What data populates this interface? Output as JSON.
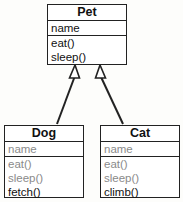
{
  "diagram": {
    "type": "uml-class-inheritance",
    "classes": {
      "pet": {
        "name": "Pet",
        "attributes": [
          "name"
        ],
        "methods": [
          "eat()",
          "sleep()"
        ]
      },
      "dog": {
        "name": "Dog",
        "inherited_attributes": [
          "name"
        ],
        "inherited_methods": [
          "eat()",
          "sleep()"
        ],
        "own_methods": [
          "fetch()"
        ]
      },
      "cat": {
        "name": "Cat",
        "inherited_attributes": [
          "name"
        ],
        "inherited_methods": [
          "eat()",
          "sleep()"
        ],
        "own_methods": [
          "climb()"
        ]
      }
    },
    "relationships": [
      {
        "from": "Dog",
        "to": "Pet",
        "kind": "generalization"
      },
      {
        "from": "Cat",
        "to": "Pet",
        "kind": "generalization"
      }
    ],
    "colors": {
      "border": "#222222",
      "text": "#111111",
      "inherited_text": "#8a8a8a",
      "background": "#ffffff"
    }
  }
}
